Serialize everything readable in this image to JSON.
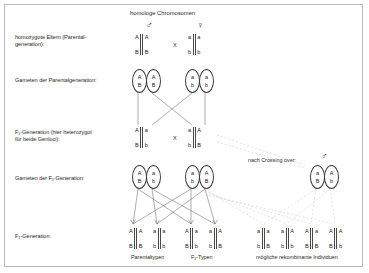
{
  "diagram": {
    "title": "homologe Chromosomen",
    "symbols": {
      "male": "♂",
      "female": "♀"
    },
    "cross_mark": "X",
    "crossing_over_note": "nach Crossing over:",
    "row_labels": {
      "parents": "homozygote Eltern (Parental-generation):",
      "parents_line1": "homozygote Eltern (Parental-",
      "parents_line2": "generation):",
      "gametes_p": "Gameten der Parentalgeneration:",
      "f1_line1": "F₁-Generation (hier heterozygot",
      "f1_line2": "für beide Genloci):",
      "gametes_f1": "Gameten der F₁-Generation:",
      "f2": "F₂-Generation:"
    },
    "captions": {
      "parental_types": "Parentaltypen",
      "f1_types": "F₁-Typen",
      "recombinants": "mögliche rekombinante Individuen"
    },
    "parents": {
      "male": {
        "left_top": "A",
        "left_bottom": "B",
        "right_top": "A",
        "right_bottom": "B"
      },
      "female": {
        "left_top": "a",
        "left_bottom": "b",
        "right_top": "a",
        "right_bottom": "b"
      }
    },
    "gametes_parental": [
      {
        "top": "A",
        "bottom": "B"
      },
      {
        "top": "A",
        "bottom": "B"
      },
      {
        "top": "a",
        "bottom": "b"
      },
      {
        "top": "a",
        "bottom": "b"
      }
    ],
    "f1_generation": {
      "male": {
        "left_top": "A",
        "left_bottom": "B",
        "right_top": "a",
        "right_bottom": "b"
      },
      "female": {
        "left_top": "a",
        "left_bottom": "b",
        "right_top": "A",
        "right_bottom": "B"
      }
    },
    "gametes_f1": [
      {
        "top": "A",
        "bottom": "B"
      },
      {
        "top": "a",
        "bottom": "b"
      },
      {
        "top": "a",
        "bottom": "b"
      },
      {
        "top": "A",
        "bottom": "B"
      }
    ],
    "gametes_crossover": [
      {
        "top": "a",
        "bottom": "B"
      },
      {
        "top": "A",
        "bottom": "b"
      }
    ],
    "f2_parental_types": [
      {
        "left_top": "A",
        "left_bottom": "B",
        "right_top": "A",
        "right_bottom": "B"
      },
      {
        "left_top": "a",
        "left_bottom": "b",
        "right_top": "a",
        "right_bottom": "b"
      }
    ],
    "f2_f1_types": [
      {
        "left_top": "A",
        "left_bottom": "B",
        "right_top": "a",
        "right_bottom": "b"
      },
      {
        "left_top": "a",
        "left_bottom": "b",
        "right_top": "A",
        "right_bottom": "B"
      }
    ],
    "f2_recombinants": [
      {
        "left_top": "a",
        "left_bottom": "b",
        "right_top": "a",
        "right_bottom": "B"
      },
      {
        "left_top": "a",
        "left_bottom": "b",
        "right_top": "A",
        "right_bottom": "b"
      },
      {
        "left_top": "A",
        "left_bottom": "B",
        "right_top": "a",
        "right_bottom": "B"
      },
      {
        "left_top": "A",
        "left_bottom": "B",
        "right_top": "A",
        "right_bottom": "b"
      }
    ],
    "colors": {
      "border": "#b9b9b9",
      "line": "#4a4a4a",
      "dashed_line": "#c6c6c6",
      "text": "#1f1f1f",
      "background": "#ffffff"
    }
  }
}
